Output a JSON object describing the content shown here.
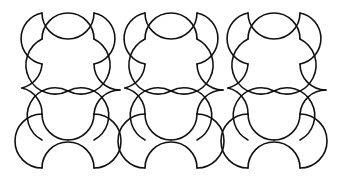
{
  "figure": {
    "stroke_color": "#111111",
    "background_color": "#ffffff",
    "tile_radius_px": 26,
    "horizontal_period_px": 103,
    "columns": 3,
    "origin_x": 42
  }
}
